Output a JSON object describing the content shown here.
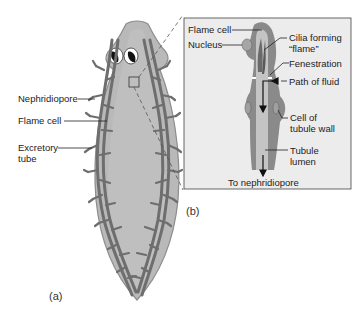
{
  "figure": {
    "panel_a": {
      "letter": "(a)",
      "labels": {
        "nephridiopore": "Nephridiopore",
        "flame_cell": "Flame cell",
        "excretory_tube_1": "Excretory",
        "excretory_tube_2": "tube"
      }
    },
    "panel_b": {
      "letter": "(b)",
      "labels": {
        "flame_cell": "Flame cell",
        "nucleus": "Nucleus",
        "cilia_1": "Cilia forming",
        "cilia_2": "“flame”",
        "fenestration": "Fenestration",
        "path_of_fluid": "Path of fluid",
        "cell_wall_1": "Cell of",
        "cell_wall_2": "tubule wall",
        "lumen_1": "Tubule",
        "lumen_2": "lumen",
        "to_nephridiopore": "To nephridiopore"
      }
    },
    "colors": {
      "body_fill": "#b9b9b9",
      "body_edge": "#8c8c8c",
      "tube": "#6e6e6e",
      "panel_bg": "#ececec",
      "lumen": "#c4c4c4"
    }
  }
}
